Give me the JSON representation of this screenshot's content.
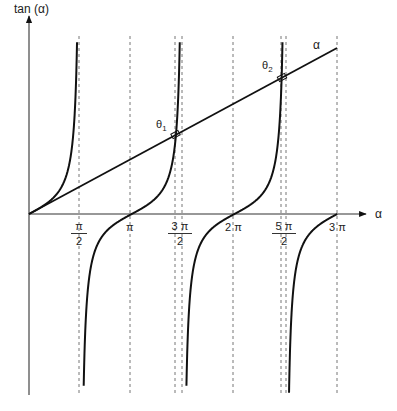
{
  "diagram": {
    "y_axis_label": "tan (α)",
    "x_axis_label": "α",
    "line_label": "α",
    "theta1": {
      "symbol": "θ",
      "sub": "1"
    },
    "theta2": {
      "symbol": "θ",
      "sub": "2"
    },
    "ticks": {
      "pi_over_2": {
        "num": "π",
        "den": "2"
      },
      "pi": "π",
      "three_pi_over_2": {
        "num": "3 π",
        "den": "2"
      },
      "two_pi": "2 π",
      "five_pi_over_2": {
        "num": "5 π",
        "den": "2"
      },
      "three_pi": "3 π"
    },
    "colors": {
      "curve": "#111111",
      "axis": "#333333",
      "dashed": "#777777"
    }
  }
}
